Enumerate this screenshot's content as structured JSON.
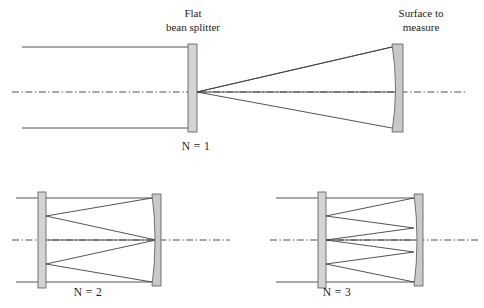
{
  "figure": {
    "background_color": "#ffffff",
    "ray_color": "#404040",
    "optic_fill_color": "#d4d4d4",
    "optic_stroke_color": "#555555",
    "axis_color": "#3a3a3a"
  },
  "labels": {
    "beam_splitter_line1": "Flat",
    "beam_splitter_line2": "bean splitter",
    "surface_line1": "Surface to",
    "surface_line2": "measure"
  },
  "panels": [
    {
      "id": "n1",
      "caption": "N = 1",
      "caption_x": 196,
      "caption_y": 147,
      "passes": 1,
      "splitter": {
        "x": 188,
        "y": 44,
        "width": 9,
        "height": 88
      },
      "mirror": {
        "x": 392,
        "y": 44,
        "width": 11,
        "height": 88,
        "sagitta": 7
      },
      "axis": {
        "x1": 12,
        "x2": 466,
        "y": 92
      },
      "input_rays": [
        {
          "x1": 22,
          "y1": 47,
          "x2": 188,
          "y2": 47
        },
        {
          "x1": 22,
          "y1": 128,
          "x2": 188,
          "y2": 128
        }
      ],
      "cavity_rays": [
        {
          "x1": 197,
          "y1": 92,
          "x2": 392,
          "y2": 47
        },
        {
          "x1": 197,
          "y1": 92,
          "x2": 392,
          "y2": 128
        },
        {
          "x1": 197,
          "y1": 92,
          "x2": 396,
          "y2": 92
        }
      ]
    },
    {
      "id": "n2",
      "caption": "N = 2",
      "caption_x": 88,
      "caption_y": 293,
      "passes": 2,
      "splitter": {
        "x": 38,
        "y": 192,
        "width": 8,
        "height": 96
      },
      "mirror": {
        "x": 152,
        "y": 194,
        "width": 9,
        "height": 92,
        "sagitta": 6
      },
      "axis": {
        "x1": 12,
        "x2": 230,
        "y": 240
      },
      "input_rays": [
        {
          "x1": 16,
          "y1": 198,
          "x2": 38,
          "y2": 198
        },
        {
          "x1": 16,
          "y1": 282,
          "x2": 38,
          "y2": 282
        }
      ],
      "cavity_rays": [
        {
          "x1": 46,
          "y1": 198,
          "x2": 152,
          "y2": 198
        },
        {
          "x1": 152,
          "y1": 198,
          "x2": 46,
          "y2": 216
        },
        {
          "x1": 46,
          "y1": 216,
          "x2": 155,
          "y2": 240
        },
        {
          "x1": 46,
          "y1": 282,
          "x2": 152,
          "y2": 282
        },
        {
          "x1": 152,
          "y1": 282,
          "x2": 46,
          "y2": 264
        },
        {
          "x1": 46,
          "y1": 264,
          "x2": 155,
          "y2": 240
        },
        {
          "x1": 46,
          "y1": 240,
          "x2": 155,
          "y2": 240
        }
      ]
    },
    {
      "id": "n3",
      "caption": "N = 3",
      "caption_x": 337,
      "caption_y": 293,
      "passes": 3,
      "splitter": {
        "x": 318,
        "y": 192,
        "width": 8,
        "height": 96
      },
      "mirror": {
        "x": 414,
        "y": 194,
        "width": 9,
        "height": 92,
        "sagitta": 6
      },
      "axis": {
        "x1": 270,
        "x2": 480,
        "y": 240
      },
      "input_rays": [
        {
          "x1": 276,
          "y1": 198,
          "x2": 318,
          "y2": 198
        },
        {
          "x1": 276,
          "y1": 282,
          "x2": 318,
          "y2": 282
        }
      ],
      "cavity_rays": [
        {
          "x1": 326,
          "y1": 198,
          "x2": 414,
          "y2": 198
        },
        {
          "x1": 414,
          "y1": 198,
          "x2": 326,
          "y2": 216
        },
        {
          "x1": 326,
          "y1": 216,
          "x2": 414,
          "y2": 228
        },
        {
          "x1": 414,
          "y1": 228,
          "x2": 326,
          "y2": 240
        },
        {
          "x1": 326,
          "y1": 282,
          "x2": 414,
          "y2": 282
        },
        {
          "x1": 414,
          "y1": 282,
          "x2": 326,
          "y2": 264
        },
        {
          "x1": 326,
          "y1": 264,
          "x2": 414,
          "y2": 252
        },
        {
          "x1": 414,
          "y1": 252,
          "x2": 326,
          "y2": 240
        },
        {
          "x1": 326,
          "y1": 240,
          "x2": 417,
          "y2": 240
        }
      ]
    }
  ],
  "callouts": {
    "beam_splitter": {
      "x": 193,
      "line1_y": 14,
      "line2_y": 28
    },
    "surface": {
      "x": 421,
      "line1_y": 14,
      "line2_y": 28
    }
  }
}
